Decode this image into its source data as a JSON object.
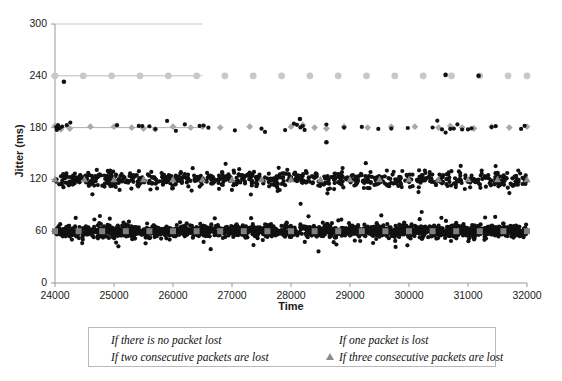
{
  "chart_data": {
    "type": "scatter",
    "title": "",
    "xlabel": "Time",
    "ylabel": "Jitter (ms)",
    "xlim": [
      24000,
      32000
    ],
    "ylim": [
      0,
      300
    ],
    "xticks": [
      24000,
      25000,
      26000,
      27000,
      28000,
      29000,
      30000,
      31000,
      32000
    ],
    "yticks": [
      0,
      60,
      120,
      180,
      240,
      300
    ],
    "grid": true,
    "legend_position": "bottom",
    "series": [
      {
        "name": "If there is no packet lost",
        "marker": "square",
        "color": "#3d3d3d",
        "level_ms": 60,
        "description": "Dense cloud of jitter samples centred on 60 ms spanning the full 24000-32000 time range, spread roughly 40-85 ms with sparse outliers down to 5 ms and up to 100 ms",
        "marker_x": [
          24000,
          24400,
          24800,
          25200,
          25600,
          26000,
          26400,
          26800,
          27200,
          27600,
          28000,
          28400,
          28800,
          29200,
          29600,
          30000,
          30400,
          30800,
          31200,
          31600,
          32000
        ],
        "marker_y": [
          60,
          60,
          60,
          60,
          60,
          60,
          60,
          60,
          60,
          60,
          60,
          60,
          60,
          60,
          60,
          60,
          60,
          60,
          60,
          60,
          60
        ]
      },
      {
        "name": "If one packet is lost",
        "marker": "triangle",
        "color": "#8c8c8c",
        "level_ms": 120,
        "description": "Dense band of jitter samples centred on 120 ms spanning the full time range, spread roughly 105-135 ms with outliers up to 160 ms",
        "marker_x": [
          24000,
          24500,
          25000,
          25500,
          26000,
          26500,
          27000,
          27500,
          28000,
          28500,
          29000,
          29500,
          30000,
          30500,
          31000,
          31500,
          32000
        ],
        "marker_y": [
          120,
          120,
          120,
          120,
          120,
          120,
          120,
          120,
          120,
          120,
          120,
          120,
          120,
          120,
          120,
          120,
          120
        ]
      },
      {
        "name": "If two consecutive packets are lost",
        "marker": "diamond",
        "color": "#2f2f2f",
        "level_ms": 180,
        "description": "Sparse points near 180 ms across the whole range, with a connecting line segment visible from 24000 to about 26500",
        "marker_x": [
          24000,
          24100,
          24250,
          24600,
          25000,
          25300,
          25500,
          25700,
          26000,
          26300,
          26500,
          26800,
          27300,
          28000,
          28200,
          28400,
          28600,
          28900,
          29300,
          29700,
          30100,
          30500,
          30700,
          30900,
          31100,
          31400,
          31700,
          32000
        ],
        "marker_y": [
          182,
          178,
          179,
          181,
          181,
          180,
          179,
          178,
          181,
          180,
          181,
          180,
          181,
          181,
          183,
          180,
          179,
          181,
          180,
          181,
          181,
          180,
          182,
          180,
          179,
          181,
          180,
          181
        ]
      },
      {
        "name": "If three consecutive packets are lost",
        "marker": "circle",
        "color": "#c8c8c8",
        "level_ms": 240,
        "description": "Evenly spaced points at 240 ms across the whole range, with a connecting line segment visible from 24000 to about 26500",
        "marker_x": [
          24000,
          24480,
          24960,
          25440,
          25920,
          26400,
          26880,
          27360,
          27840,
          28320,
          28800,
          29280,
          29760,
          30240,
          30720,
          31200,
          31680,
          32000
        ],
        "marker_y": [
          240,
          240,
          240,
          240,
          240,
          240,
          240,
          240,
          240,
          240,
          240,
          240,
          240,
          240,
          240,
          240,
          240,
          240
        ]
      }
    ],
    "annotations": {
      "gridline_300_partial": "A faint horizontal gridline at 300 ms extends from the y-axis to about x = 26500",
      "outlier_near_axis": "A black point sits just below 240 ms at roughly x = 24150"
    }
  },
  "axis": {
    "y_title": "Jitter (ms)",
    "x_title": "Time",
    "y_labels": [
      "300",
      "240",
      "180",
      "120",
      "60",
      "0"
    ],
    "x_labels": [
      "24000",
      "25000",
      "26000",
      "27000",
      "28000",
      "29000",
      "30000",
      "31000",
      "32000"
    ]
  },
  "legend": {
    "entries": [
      {
        "label": "If there is no packet lost",
        "marker": "square-marker"
      },
      {
        "label": "If one packet is lost",
        "marker": "triangle-marker"
      },
      {
        "label": "If  two consecutive packets are lost",
        "marker": "diamond-marker"
      },
      {
        "label": "If three consecutive packets are lost",
        "marker": "circle-marker"
      }
    ]
  },
  "colors": {
    "axis": "#9a9a9a",
    "gridline": "#c9c9c9",
    "scatter": "#111111",
    "marker_gray": "#8c8c8c",
    "marker_light": "#c8c8c8"
  }
}
